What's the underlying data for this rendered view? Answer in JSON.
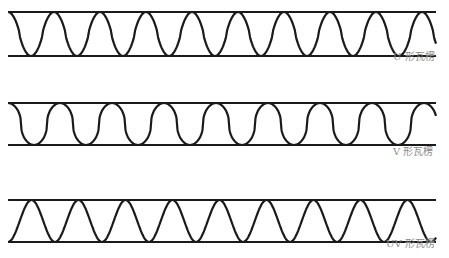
{
  "figure": {
    "rows": [
      {
        "id": "u-flute",
        "label": "U 形瓦楞",
        "top_y": 12,
        "bottom_y": 56,
        "x_start": 8,
        "x_end": 436,
        "shape": "sharp",
        "period": 46,
        "phase_start": "top"
      },
      {
        "id": "v-flute",
        "label": "V 形瓦楞",
        "top_y": 103,
        "bottom_y": 145,
        "x_start": 8,
        "x_end": 436,
        "shape": "rounded",
        "period": 52,
        "phase_start": "top"
      },
      {
        "id": "uv-flute",
        "label": "UV 形瓦楞",
        "top_y": 200,
        "bottom_y": 242,
        "x_start": 8,
        "x_end": 436,
        "shape": "sine",
        "period": 47,
        "phase_start": "bottom"
      }
    ],
    "colors": {
      "line": "#1a1a1a",
      "label": "#8a8a8a",
      "background": "#ffffff"
    }
  }
}
